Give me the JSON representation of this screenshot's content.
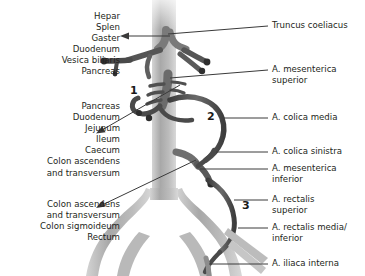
{
  "diagram": {
    "colors": {
      "background": "#ffffff",
      "text": "#231f20",
      "aorta_band": "#b3b3b3",
      "vessel_light": "#9d9d9d",
      "vessel_dark": "#4d4d4d",
      "leader_line": "#3a3a3a"
    }
  },
  "organ_groups": [
    {
      "name": "celiac-trunk-organs",
      "marker": null,
      "arrow": true,
      "lines": [
        "Hepar",
        "Splen",
        "Gaster",
        "Duodenum",
        "Vesica biliaris",
        "Pancreas"
      ]
    },
    {
      "name": "superior-mesenteric-organs",
      "marker": "1",
      "arrow": true,
      "lines": [
        "Pancreas",
        "Duodenum",
        "Jejunum",
        "Ileum",
        "Caecum",
        "Colon ascendens",
        "and transversum"
      ]
    },
    {
      "name": "inferior-mesenteric-organs",
      "marker": null,
      "arrow": true,
      "lines": [
        "Colon ascendens",
        "and transversum",
        "Colon sigmoideum",
        "Rectum"
      ]
    }
  ],
  "artery_labels": [
    {
      "name": "truncus-coeliacus",
      "lines": [
        "Truncus coeliacus"
      ]
    },
    {
      "name": "a-mesenterica-superior",
      "lines": [
        "A. mesenterica",
        "superior"
      ]
    },
    {
      "name": "a-colica-media",
      "lines": [
        "A. colica  media"
      ]
    },
    {
      "name": "a-colica-sinistra",
      "lines": [
        "A. colica sinistra"
      ]
    },
    {
      "name": "a-mesenterica-inferior",
      "lines": [
        "A. mesenterica",
        "inferior"
      ]
    },
    {
      "name": "a-rectalis-superior",
      "lines": [
        "A. rectalis",
        "superior"
      ]
    },
    {
      "name": "a-rectalis-media-inferior",
      "lines": [
        "A. rectalis media/",
        "inferior"
      ]
    },
    {
      "name": "a-iliaca-interna",
      "lines": [
        "A. iliaca interna"
      ]
    }
  ],
  "markers": [
    {
      "name": "region-marker-1",
      "value": "1"
    },
    {
      "name": "region-marker-2",
      "value": "2"
    },
    {
      "name": "region-marker-3",
      "value": "3"
    }
  ]
}
